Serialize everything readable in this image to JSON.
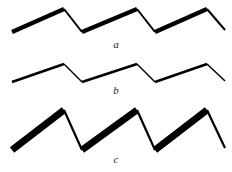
{
  "figure": {
    "title": "",
    "background_color": "#ffffff",
    "ink_color": "#000000",
    "panel_count": 3
  },
  "chart_data": {
    "type": "line",
    "title": "",
    "subtitle": "",
    "xlabel": "",
    "ylabel": "",
    "grid": false,
    "legend": "none",
    "axis_visible": false,
    "xlim": [
      0,
      232
    ],
    "shared_vertex_x": [
      12,
      64,
      82,
      137,
      155,
      207,
      225
    ],
    "series": [
      {
        "name": "a",
        "label": "a",
        "amplitude_px": 23,
        "rising_stroke_width_px": 4.2,
        "falling_stroke_width_px": 2.0,
        "peak_y_px": [
          9,
          9,
          9
        ],
        "valley_y_px": [
          32,
          32
        ],
        "start_y_px": 32,
        "end_y_px": 30,
        "points": [
          [
            12,
            32
          ],
          [
            64,
            9
          ],
          [
            82,
            32
          ],
          [
            137,
            9
          ],
          [
            155,
            32
          ],
          [
            207,
            9
          ],
          [
            225,
            30
          ]
        ],
        "segments": [
          {
            "from": [
              12,
              32
            ],
            "to": [
              64,
              9
            ],
            "direction": "rising",
            "weight": "thick"
          },
          {
            "from": [
              64,
              9
            ],
            "to": [
              82,
              32
            ],
            "direction": "falling",
            "weight": "thin"
          },
          {
            "from": [
              82,
              32
            ],
            "to": [
              137,
              9
            ],
            "direction": "rising",
            "weight": "thick"
          },
          {
            "from": [
              137,
              9
            ],
            "to": [
              155,
              32
            ],
            "direction": "falling",
            "weight": "thin"
          },
          {
            "from": [
              155,
              32
            ],
            "to": [
              207,
              9
            ],
            "direction": "rising",
            "weight": "thick"
          },
          {
            "from": [
              207,
              9
            ],
            "to": [
              225,
              30
            ],
            "direction": "falling",
            "weight": "thin"
          }
        ]
      },
      {
        "name": "b",
        "label": "b",
        "amplitude_px": 18,
        "rising_stroke_width_px": 2.6,
        "falling_stroke_width_px": 1.5,
        "peak_y_px": [
          8,
          8,
          8
        ],
        "valley_y_px": [
          26,
          26
        ],
        "start_y_px": 26,
        "end_y_px": 25,
        "points": [
          [
            12,
            26
          ],
          [
            64,
            8
          ],
          [
            82,
            26
          ],
          [
            137,
            8
          ],
          [
            155,
            26
          ],
          [
            207,
            8
          ],
          [
            225,
            25
          ]
        ],
        "segments": [
          {
            "from": [
              12,
              26
            ],
            "to": [
              64,
              8
            ],
            "direction": "rising",
            "weight": "medium"
          },
          {
            "from": [
              64,
              8
            ],
            "to": [
              82,
              26
            ],
            "direction": "falling",
            "weight": "hairline"
          },
          {
            "from": [
              82,
              26
            ],
            "to": [
              137,
              8
            ],
            "direction": "rising",
            "weight": "medium"
          },
          {
            "from": [
              137,
              8
            ],
            "to": [
              155,
              26
            ],
            "direction": "falling",
            "weight": "hairline"
          },
          {
            "from": [
              155,
              26
            ],
            "to": [
              207,
              8
            ],
            "direction": "rising",
            "weight": "medium"
          },
          {
            "from": [
              207,
              8
            ],
            "to": [
              225,
              25
            ],
            "direction": "falling",
            "weight": "hairline"
          }
        ]
      },
      {
        "name": "c",
        "label": "c",
        "amplitude_px": 40,
        "rising_stroke_width_px": 7.0,
        "falling_stroke_width_px": 2.2,
        "peak_y_px": [
          6,
          6,
          6
        ],
        "valley_y_px": [
          46,
          46
        ],
        "start_y_px": 46,
        "end_y_px": 44,
        "points": [
          [
            12,
            46
          ],
          [
            64,
            6
          ],
          [
            82,
            46
          ],
          [
            137,
            6
          ],
          [
            155,
            46
          ],
          [
            207,
            6
          ],
          [
            225,
            44
          ]
        ],
        "segments": [
          {
            "from": [
              12,
              46
            ],
            "to": [
              64,
              6
            ],
            "direction": "rising",
            "weight": "extra-thick"
          },
          {
            "from": [
              64,
              6
            ],
            "to": [
              82,
              46
            ],
            "direction": "falling",
            "weight": "thin"
          },
          {
            "from": [
              82,
              46
            ],
            "to": [
              137,
              6
            ],
            "direction": "rising",
            "weight": "extra-thick"
          },
          {
            "from": [
              137,
              6
            ],
            "to": [
              155,
              46
            ],
            "direction": "falling",
            "weight": "thin"
          },
          {
            "from": [
              155,
              46
            ],
            "to": [
              207,
              6
            ],
            "direction": "rising",
            "weight": "extra-thick"
          },
          {
            "from": [
              207,
              6
            ],
            "to": [
              225,
              44
            ],
            "direction": "falling",
            "weight": "thin"
          }
        ]
      }
    ]
  },
  "labels": {
    "a": "a",
    "b": "b",
    "c": "c"
  }
}
